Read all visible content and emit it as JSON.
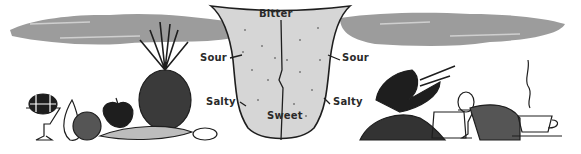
{
  "diagram": {
    "labels": {
      "bitter": "Bitter",
      "sour_left": "Sour",
      "sour_right": "Sour",
      "salty_left": "Salty",
      "salty_right": "Salty",
      "sweet": "Sweet"
    },
    "colors": {
      "background": "#ffffff",
      "cloud": "#9a9a9a",
      "tongue_fill": "#dcdcdc",
      "ink": "#1e1e1e"
    },
    "left_foods": [
      "sundae-glass",
      "pear",
      "melon",
      "apple",
      "pineapple",
      "corn",
      "nuts"
    ],
    "right_foods": [
      "lobster-claw",
      "gravel-pile",
      "pickle-jar",
      "egg-cup",
      "bread-loaf",
      "coffee-cup"
    ]
  }
}
